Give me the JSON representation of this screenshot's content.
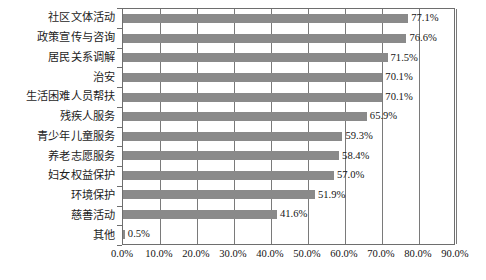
{
  "chart_data": {
    "type": "bar",
    "orientation": "horizontal",
    "title": "",
    "xlabel": "",
    "ylabel": "",
    "xlim": [
      0,
      90
    ],
    "xticks": [
      "0.0%",
      "10.0%",
      "20.0%",
      "30.0%",
      "40.0%",
      "50.0%",
      "60.0%",
      "70.0%",
      "80.0%",
      "90.0%"
    ],
    "xtick_values": [
      0,
      10,
      20,
      30,
      40,
      50,
      60,
      70,
      80,
      90
    ],
    "grid": true,
    "legend": "none",
    "categories": [
      "社区文体活动",
      "政策宣传与咨询",
      "居民关系调解",
      "治安",
      "生活困难人员帮扶",
      "残疾人服务",
      "青少年儿童服务",
      "养老志愿服务",
      "妇女权益保护",
      "环境保护",
      "慈善活动",
      "其他"
    ],
    "values": [
      77.1,
      76.6,
      71.5,
      70.1,
      70.1,
      65.9,
      59.3,
      58.4,
      57.0,
      51.9,
      41.6,
      0.5
    ],
    "value_labels": [
      "77.1%",
      "76.6%",
      "71.5%",
      "70.1%",
      "70.1%",
      "65.9%",
      "59.3%",
      "58.4%",
      "57.0%",
      "51.9%",
      "41.6%",
      "0.5%"
    ],
    "colors": {
      "bar": "#8a8a8a",
      "axis": "#6e6e6e",
      "grid": "#7a7a7a",
      "text": "#151515",
      "background": "#ffffff"
    }
  }
}
